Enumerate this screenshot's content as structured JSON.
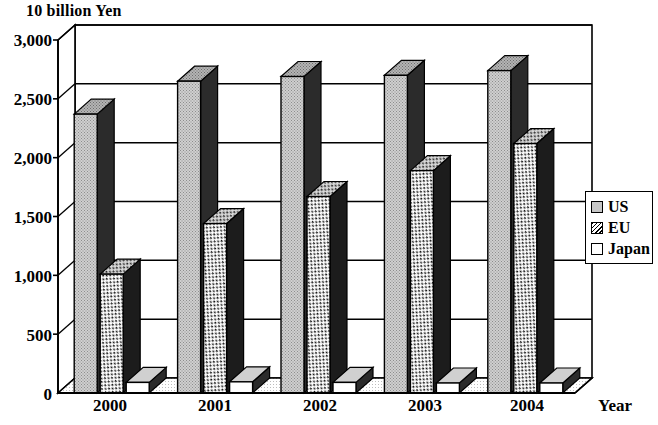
{
  "chart_data": {
    "type": "bar",
    "title": "10 billion Yen",
    "subtitle": "",
    "xlabel": "Year",
    "ylabel": "10 billion Yen",
    "categories": [
      "2000",
      "2001",
      "2002",
      "2003",
      "2004"
    ],
    "series": [
      {
        "name": "US",
        "values": [
          2370,
          2650,
          2690,
          2700,
          2740
        ],
        "fill": "#c6c6c6",
        "pattern": "solid-gray"
      },
      {
        "name": "EU",
        "values": [
          1010,
          1440,
          1670,
          1890,
          2120
        ],
        "fill": "#ffffff",
        "pattern": "hatched"
      },
      {
        "name": "Japan",
        "values": [
          90,
          95,
          90,
          85,
          85
        ],
        "fill": "#ffffff",
        "pattern": "plain"
      }
    ],
    "ylim": [
      0,
      3000
    ],
    "yticks": [
      "0",
      "500",
      "1,000",
      "1,500",
      "2,000",
      "2,500",
      "3,000"
    ],
    "ytick_values": [
      0,
      500,
      1000,
      1500,
      2000,
      2500,
      3000
    ],
    "grid": true,
    "grid_axis": "y",
    "legend_position": "right",
    "style_3d": true
  },
  "legend": {
    "items": [
      {
        "label": "US"
      },
      {
        "label": "EU"
      },
      {
        "label": "Japan"
      }
    ]
  },
  "colors": {
    "us_fill": "#c6c6c6",
    "eu_fill": "#ffffff",
    "japan_fill": "#ffffff",
    "side_shade": "#2b2b2b",
    "top_shade": "#9a9a9a",
    "axis": "#000000",
    "background": "#ffffff"
  }
}
